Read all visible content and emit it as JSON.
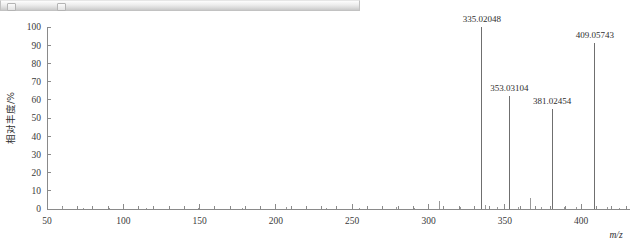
{
  "toolbar": {
    "present": true,
    "button_1": "",
    "button_2": ""
  },
  "chart_data": {
    "type": "bar",
    "title": "",
    "subtitle": "",
    "xlabel": "m/z",
    "ylabel": "相对丰度/%",
    "xlim": [
      50,
      432
    ],
    "ylim": [
      0,
      100
    ],
    "grid": false,
    "legend": "none",
    "x_major_ticks": [
      50,
      100,
      150,
      200,
      250,
      300,
      350,
      400
    ],
    "x_major_tick_labels": [
      "50",
      "100",
      "150",
      "200",
      "250",
      "300",
      "350",
      "400"
    ],
    "x_minor_tick_step": 10,
    "y_ticks": [
      0,
      10,
      20,
      30,
      40,
      50,
      60,
      70,
      80,
      90,
      100
    ],
    "y_tick_labels": [
      "0",
      "10",
      "20",
      "30",
      "40",
      "50",
      "60",
      "70",
      "80",
      "90",
      "100"
    ],
    "labeled_peaks": [
      {
        "mz": 335.02048,
        "label": "335.02048",
        "intensity": 100.0
      },
      {
        "mz": 353.03104,
        "label": "353.03104",
        "intensity": 62.0
      },
      {
        "mz": 381.02454,
        "label": "381.02454",
        "intensity": 55.0
      },
      {
        "mz": 409.05743,
        "label": "409.05743",
        "intensity": 91.0
      }
    ],
    "minor_peaks": [
      {
        "mz": 60,
        "intensity": 1.0
      },
      {
        "mz": 74,
        "intensity": 0.8
      },
      {
        "mz": 91,
        "intensity": 0.7
      },
      {
        "mz": 115,
        "intensity": 0.6
      },
      {
        "mz": 149,
        "intensity": 0.8
      },
      {
        "mz": 178,
        "intensity": 0.6
      },
      {
        "mz": 207,
        "intensity": 1.0
      },
      {
        "mz": 233,
        "intensity": 0.7
      },
      {
        "mz": 255,
        "intensity": 0.6
      },
      {
        "mz": 279,
        "intensity": 0.9
      },
      {
        "mz": 291,
        "intensity": 0.7
      },
      {
        "mz": 307,
        "intensity": 4.5
      },
      {
        "mz": 321,
        "intensity": 1.2
      },
      {
        "mz": 337,
        "intensity": 2.0
      },
      {
        "mz": 345,
        "intensity": 0.9
      },
      {
        "mz": 359,
        "intensity": 1.1
      },
      {
        "mz": 367,
        "intensity": 6.0
      },
      {
        "mz": 374,
        "intensity": 1.0
      },
      {
        "mz": 389,
        "intensity": 0.9
      },
      {
        "mz": 397,
        "intensity": 1.3
      },
      {
        "mz": 417,
        "intensity": 0.9
      },
      {
        "mz": 425,
        "intensity": 0.7
      }
    ],
    "colors": {
      "peak": "#6f6f6f",
      "minor_peak": "#9a9a9a",
      "axis": "#8a8a8a",
      "text": "#2e2e2e",
      "background": "#ffffff"
    }
  }
}
